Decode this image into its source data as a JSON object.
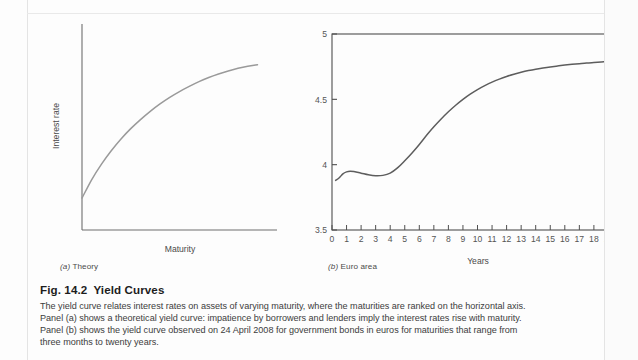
{
  "figure": {
    "title_number": "Fig. 14.2",
    "title_text": "Yield Curves",
    "caption_lines": [
      "The yield curve relates interest rates on assets of varying maturity, where the maturities are ranked on the horizontal axis.",
      "Panel (a) shows a theoretical yield curve: impatience by borrowers and lenders imply the interest rates rise with maturity.",
      "Panel (b) shows the yield curve observed on 24 April 2008 for government bonds in euros for maturities that range from",
      "three months to twenty years."
    ]
  },
  "panel_a": {
    "label_prefix": "(a)",
    "label_text": "Theory",
    "label_full": "(a) Theory",
    "ylabel": "Interest rate",
    "xlabel": "Maturity"
  },
  "panel_b": {
    "label_prefix": "(b)",
    "label_text": "Euro area",
    "label_full": "(b) Euro area",
    "xlabel": "Years"
  },
  "colors": {
    "curve_a": "#9a9a9a",
    "curve_b": "#5d5d5d",
    "axis": "#6e6e6e",
    "frame": "#4f4f4f",
    "tick_label": "#555555",
    "caption_text": "#3c3c3c",
    "title_text": "#1d1d1d",
    "page": "#fdfdfd"
  },
  "chart_data": [
    {
      "type": "line",
      "id": "panel-a-theory",
      "title": "(a) Theory",
      "xlabel": "Maturity",
      "ylabel": "Interest rate",
      "grid": false,
      "legend": "none",
      "axis_ticks": "none",
      "xlim": [
        0,
        10
      ],
      "ylim": [
        0,
        10
      ],
      "x": [
        0,
        0.5,
        1,
        1.5,
        2,
        2.5,
        3,
        3.5,
        4,
        4.5,
        5,
        5.5,
        6,
        6.5,
        7,
        7.5,
        8,
        8.5,
        9
      ],
      "values": [
        1.55,
        2.45,
        3.2,
        3.85,
        4.42,
        4.92,
        5.36,
        5.76,
        6.12,
        6.44,
        6.72,
        6.97,
        7.2,
        7.4,
        7.57,
        7.72,
        7.85,
        7.95,
        8.02
      ],
      "note": "Schematic concave increasing curve; axes unlabelled with no numeric ticks."
    },
    {
      "type": "line",
      "id": "panel-b-euro-area",
      "title": "(b) Euro area",
      "xlabel": "Years",
      "ylabel": "",
      "grid": false,
      "legend": "none",
      "xlim": [
        0,
        20
      ],
      "ylim": [
        3.5,
        5
      ],
      "yticks": [
        3.5,
        4,
        4.5,
        5
      ],
      "ytick_labels": [
        "3.5",
        "4",
        "4.5",
        "5"
      ],
      "xticks": [
        0,
        1,
        2,
        3,
        4,
        5,
        6,
        7,
        8,
        9,
        10,
        11,
        12,
        13,
        14,
        15,
        16,
        17,
        18,
        19,
        20
      ],
      "xtick_labels": [
        "0",
        "1",
        "2",
        "3",
        "4",
        "5",
        "6",
        "7",
        "8",
        "9",
        "10",
        "11",
        "12",
        "13",
        "14",
        "15",
        "16",
        "17",
        "18",
        "19",
        "20"
      ],
      "x": [
        0.25,
        0.5,
        0.75,
        1,
        1.25,
        1.5,
        2,
        2.5,
        3,
        3.5,
        4,
        4.5,
        5,
        5.5,
        6,
        6.5,
        7,
        7.5,
        8,
        8.5,
        9,
        9.5,
        10,
        10.5,
        11,
        11.5,
        12,
        12.5,
        13,
        13.5,
        14,
        14.5,
        15,
        15.5,
        16,
        16.5,
        17,
        17.5,
        18,
        18.5,
        19,
        19.5,
        20
      ],
      "values": [
        3.88,
        3.9,
        3.93,
        3.945,
        3.95,
        3.947,
        3.935,
        3.922,
        3.915,
        3.918,
        3.935,
        3.975,
        4.03,
        4.09,
        4.155,
        4.225,
        4.29,
        4.35,
        4.405,
        4.455,
        4.5,
        4.54,
        4.575,
        4.605,
        4.632,
        4.655,
        4.675,
        4.692,
        4.707,
        4.72,
        4.731,
        4.74,
        4.748,
        4.755,
        4.762,
        4.768,
        4.773,
        4.778,
        4.782,
        4.786,
        4.79,
        4.793,
        4.796
      ],
      "note": "Euro-area government bond yield curve observed 24 April 2008, maturities three months to twenty years."
    }
  ]
}
